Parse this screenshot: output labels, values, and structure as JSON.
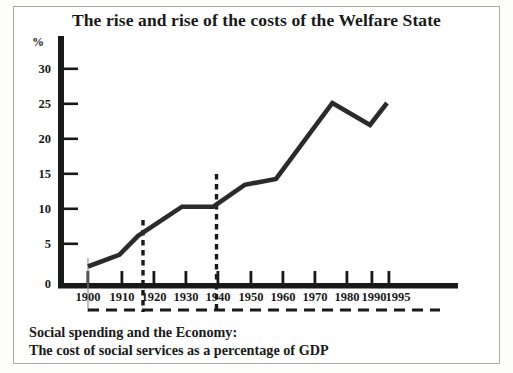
{
  "figure": {
    "title": "The rise and rise of the costs of the Welfare State",
    "caption_line1": "Social spending and the Economy:",
    "caption_line2": "The cost of social services as a percentage of GDP",
    "percent_symbol": "%"
  },
  "colors": {
    "ink": "#191919",
    "line": "#2b2b2b",
    "border": "#a8a8a4",
    "paper": "#ffffff"
  },
  "axis": {
    "y_ticks": [
      "0",
      "5",
      "10",
      "15",
      "20",
      "25",
      "30"
    ],
    "x_ticks": [
      "1900",
      "1910",
      "1920",
      "1930",
      "1940",
      "1950",
      "1960",
      "1970",
      "1980",
      "1990",
      "1995"
    ]
  },
  "chart_data": {
    "type": "line",
    "title": "The rise and rise of the costs of the Welfare State",
    "subtitle": "Social spending and the Economy: The cost of social services as a percentage of GDP",
    "xlabel": "",
    "ylabel": "%",
    "xlim": [
      1895,
      2000
    ],
    "ylim": [
      0,
      32
    ],
    "grid": false,
    "legend": false,
    "y_ticks": [
      0,
      5,
      10,
      15,
      20,
      25,
      30
    ],
    "x_ticks": [
      1900,
      1910,
      1920,
      1930,
      1940,
      1950,
      1960,
      1970,
      1980,
      1990,
      1995
    ],
    "series": [
      {
        "name": "Social spending as % of GDP",
        "x": [
          1900,
          1910,
          1916,
          1930,
          1940,
          1950,
          1960,
          1978,
          1990,
          1995
        ],
        "values": [
          2.6,
          4.2,
          6.8,
          10.8,
          10.8,
          13.8,
          14.6,
          25.0,
          22.0,
          25.0
        ]
      }
    ],
    "annotations": [
      {
        "type": "vertical-dashed-line",
        "x": 1916,
        "label": ""
      },
      {
        "type": "vertical-dashed-line",
        "x": 1940,
        "label": ""
      }
    ]
  }
}
